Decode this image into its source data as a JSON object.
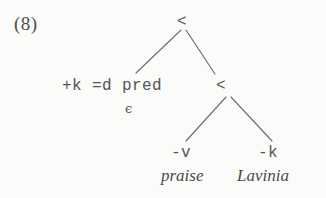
{
  "figure": {
    "example_number": "(8)",
    "background_color": "#fbfbfa",
    "ink_color": "#4a4a4a",
    "line_color": "#6d6d6f"
  },
  "tree": {
    "root": {
      "label": "<",
      "x": 183,
      "y": 22
    },
    "left_child": {
      "features": "+k =d pred",
      "feature_parts": [
        "+k",
        "=d",
        "pred"
      ],
      "phonetic_content": "ϵ",
      "x": 135,
      "y": 86
    },
    "right_child": {
      "label": "<",
      "x": 221,
      "y": 86
    },
    "leaves": [
      {
        "feature": "-v",
        "lexical_item": "praise",
        "x": 185,
        "y": 155
      },
      {
        "feature": "-k",
        "lexical_item": "Lavinia",
        "x": 272,
        "y": 155
      }
    ],
    "edges": [
      {
        "from": "root",
        "to": "left_child",
        "x1": 181,
        "y1": 30,
        "x2": 136,
        "y2": 73
      },
      {
        "from": "root",
        "to": "right_child",
        "x1": 186,
        "y1": 30,
        "x2": 215,
        "y2": 74
      },
      {
        "from": "right_child",
        "to": "leaf_praise",
        "x1": 226,
        "y1": 97,
        "x2": 186,
        "y2": 141
      },
      {
        "from": "right_child",
        "to": "leaf_lavinia",
        "x1": 231,
        "y1": 97,
        "x2": 272,
        "y2": 141
      }
    ]
  }
}
